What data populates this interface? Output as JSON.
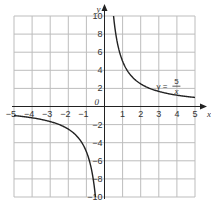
{
  "chart_data": {
    "type": "line",
    "title": "",
    "xlabel": "x",
    "ylabel": "y",
    "xlim": [
      -5,
      5
    ],
    "ylim": [
      -10,
      10
    ],
    "grid": true,
    "x_ticks": [
      -5,
      -4,
      -3,
      -2,
      -1,
      1,
      2,
      3,
      4,
      5
    ],
    "y_ticks": [
      -10,
      -8,
      -6,
      -4,
      -2,
      2,
      4,
      6,
      8,
      10
    ],
    "origin_label": "0",
    "series": [
      {
        "name": "y = 5/x",
        "function": "5/x",
        "branches": [
          {
            "x": [
              0.5,
              0.6,
              0.75,
              1,
              1.25,
              1.5,
              2,
              2.5,
              3,
              3.5,
              4,
              4.5,
              5
            ],
            "y": [
              10,
              8.33,
              6.67,
              5,
              4,
              3.33,
              2.5,
              2,
              1.67,
              1.43,
              1.25,
              1.11,
              1
            ]
          },
          {
            "x": [
              -5,
              -4.5,
              -4,
              -3.5,
              -3,
              -2.5,
              -2,
              -1.5,
              -1.25,
              -1,
              -0.75,
              -0.6,
              -0.5
            ],
            "y": [
              -1,
              -1.11,
              -1.25,
              -1.43,
              -1.67,
              -2,
              -2.5,
              -3.33,
              -4,
              -5,
              -6.67,
              -8.33,
              -10
            ]
          }
        ]
      }
    ],
    "annotations": [
      {
        "text": "y = 5/x",
        "lhs": "y =",
        "numerator": "5",
        "denominator": "x",
        "at": [
          3.2,
          2.3
        ]
      }
    ],
    "colors": {
      "grid": "#bdbdbd",
      "axis": "#222222",
      "curve": "#222222"
    }
  }
}
